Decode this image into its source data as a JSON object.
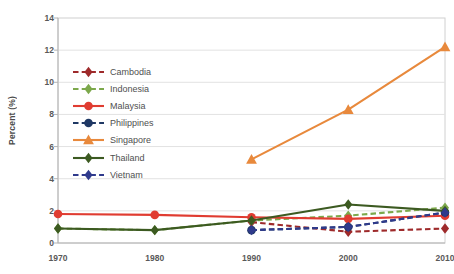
{
  "chart_data": {
    "type": "line",
    "title": "",
    "xlabel": "",
    "ylabel": "Percent (%)",
    "x": [
      1970,
      1980,
      1990,
      2000,
      2010
    ],
    "xtick_labels": [
      "1970",
      "1980",
      "1990",
      "2000",
      "2010"
    ],
    "ytick_labels": [
      "0",
      "2",
      "4",
      "6",
      "8",
      "10",
      "12",
      "14"
    ],
    "ylim": [
      0,
      14
    ],
    "ytick_step": 2,
    "grid": "horizontal",
    "legend_position": "inside-upper-left",
    "series": [
      {
        "name": "Cambodia",
        "color": "#9E2A2B",
        "dash": "dashed",
        "marker": "diamond",
        "values": [
          null,
          null,
          1.3,
          0.7,
          0.9
        ]
      },
      {
        "name": "Indonesia",
        "color": "#7CA84B",
        "dash": "dashed",
        "marker": "diamond",
        "values": [
          0.9,
          0.8,
          1.4,
          1.7,
          2.2
        ]
      },
      {
        "name": "Malaysia",
        "color": "#E03C31",
        "dash": "solid",
        "marker": "circle",
        "values": [
          1.8,
          1.75,
          1.6,
          1.5,
          1.7
        ]
      },
      {
        "name": "Philippines",
        "color": "#1F3864",
        "dash": "dashed",
        "marker": "circle",
        "values": [
          null,
          null,
          0.8,
          1.0,
          1.9
        ]
      },
      {
        "name": "Singapore",
        "color": "#E8893C",
        "dash": "solid",
        "marker": "triangle",
        "values": [
          null,
          null,
          5.2,
          8.3,
          12.2
        ]
      },
      {
        "name": "Thailand",
        "color": "#3C5A21",
        "dash": "solid",
        "marker": "diamond",
        "values": [
          0.9,
          0.8,
          1.4,
          2.4,
          2.0
        ]
      },
      {
        "name": "Vietnam",
        "color": "#2F3A8C",
        "dash": "dashed",
        "marker": "diamond",
        "values": [
          null,
          null,
          0.8,
          1.0,
          1.9
        ]
      }
    ]
  },
  "axes": {
    "y_title": "Percent (%)"
  }
}
